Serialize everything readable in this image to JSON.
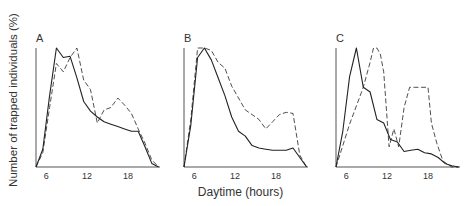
{
  "figure": {
    "ylabel": "Number of trapped individuals (%)",
    "xlabel": "Daytime (hours)",
    "line_color": "#222222"
  },
  "chart_data": [
    {
      "type": "line",
      "panel": "A",
      "title": "A",
      "xlabel": "Daytime (hours)",
      "ylabel": "Number of trapped individuals (%)",
      "xticks": [
        6,
        12,
        18
      ],
      "xlim": [
        4.5,
        22.7
      ],
      "ylim": [
        0,
        100
      ],
      "grid": false,
      "series": [
        {
          "name": "solid",
          "style": "solid",
          "x": [
            4.5,
            5.5,
            6.5,
            7.5,
            8.5,
            9.5,
            10.5,
            11.5,
            12.5,
            13.5,
            14.5,
            15.5,
            16.5,
            17.5,
            18.5,
            19.5,
            20.5,
            21.5,
            22.5
          ],
          "y": [
            0,
            15,
            60,
            100,
            92,
            93,
            75,
            55,
            47,
            42,
            38,
            36,
            34,
            32,
            30,
            30,
            17,
            3,
            0
          ]
        },
        {
          "name": "dashed",
          "style": "dashed",
          "x": [
            4.5,
            5.5,
            6.5,
            7.5,
            8.5,
            9.5,
            10.5,
            11.5,
            12.5,
            13.5,
            14.5,
            15.5,
            16.5,
            17.5,
            18.5,
            19.5,
            20.5,
            21.5,
            22.5
          ],
          "y": [
            0,
            12,
            50,
            87,
            80,
            92,
            100,
            73,
            65,
            37,
            48,
            50,
            58,
            52,
            45,
            32,
            20,
            6,
            0
          ]
        }
      ]
    },
    {
      "type": "line",
      "panel": "B",
      "title": "B",
      "xlabel": "Daytime (hours)",
      "ylabel": "Number of trapped individuals (%)",
      "xticks": [
        6,
        12,
        18
      ],
      "xlim": [
        4.5,
        22.7
      ],
      "ylim": [
        0,
        100
      ],
      "grid": false,
      "series": [
        {
          "name": "solid",
          "style": "solid",
          "x": [
            4.5,
            5.5,
            6.5,
            7.5,
            8.5,
            9.5,
            10.5,
            11.5,
            12.5,
            13.5,
            14.5,
            15.5,
            16.5,
            17.5,
            18.5,
            19.5,
            20.5,
            21.5,
            22.5
          ],
          "y": [
            0,
            35,
            92,
            100,
            90,
            75,
            60,
            42,
            30,
            26,
            18,
            16,
            15,
            14,
            14,
            14,
            16,
            8,
            0
          ]
        },
        {
          "name": "dashed",
          "style": "dashed",
          "x": [
            4.5,
            5.5,
            6.5,
            7.5,
            8.5,
            9.5,
            10.5,
            11.5,
            12.5,
            13.5,
            14.5,
            15.5,
            16.5,
            17.5,
            18.5,
            19.5,
            20.5,
            21.5,
            22.5
          ],
          "y": [
            0,
            40,
            100,
            100,
            98,
            88,
            83,
            68,
            58,
            48,
            44,
            40,
            32,
            38,
            44,
            46,
            45,
            10,
            0
          ]
        }
      ]
    },
    {
      "type": "line",
      "panel": "C",
      "title": "C",
      "xlabel": "Daytime (hours)",
      "ylabel": "Number of trapped individuals (%)",
      "xticks": [
        6,
        12,
        18
      ],
      "xlim": [
        4.5,
        22.7
      ],
      "ylim": [
        0,
        100
      ],
      "grid": false,
      "series": [
        {
          "name": "solid",
          "style": "solid",
          "x": [
            4.5,
            5.5,
            6.5,
            7.5,
            8.5,
            9.5,
            10.5,
            11.5,
            12.5,
            13.5,
            14.5,
            15.5,
            16.5,
            17.5,
            18.5,
            19.5,
            20.5,
            21.5,
            22.5
          ],
          "y": [
            0,
            30,
            76,
            100,
            67,
            63,
            40,
            37,
            23,
            21,
            13,
            14,
            15,
            12,
            11,
            8,
            3,
            1,
            0
          ]
        },
        {
          "name": "dashed",
          "style": "dashed",
          "x": [
            4.5,
            6.5,
            8.5,
            9.5,
            10.0,
            10.5,
            11.0,
            11.5,
            12.3,
            13.0,
            13.7,
            14.5,
            15.3,
            16.0,
            17.0,
            18.0,
            18.5,
            19.3,
            20.2,
            21.5,
            22.5
          ],
          "y": [
            0,
            36,
            67,
            88,
            100,
            100,
            95,
            80,
            17,
            32,
            17,
            50,
            67,
            67,
            67,
            67,
            37,
            20,
            5,
            0,
            0
          ]
        }
      ]
    }
  ]
}
